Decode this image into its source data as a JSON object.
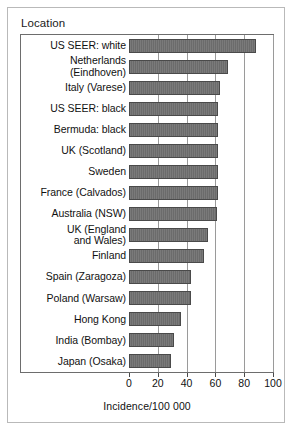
{
  "panel": {
    "title": "Location"
  },
  "chart_data": {
    "type": "bar",
    "orientation": "horizontal",
    "title": "Location",
    "xlabel": "Incidence/100 000",
    "ylabel": "Location",
    "xlim": [
      0,
      100
    ],
    "xticks": [
      0,
      20,
      40,
      60,
      80,
      100
    ],
    "xticklabels": [
      "0",
      "20",
      "40",
      "60",
      "80",
      "100"
    ],
    "grid": "vertical",
    "legend": "none",
    "bar_color": "#6b6b6b",
    "categories": [
      "US SEER: white",
      "Netherlands\n(Eindhoven)",
      "Italy (Varese)",
      "US SEER: black",
      "Bermuda: black",
      "UK (Scotland)",
      "Sweden",
      "France (Calvados)",
      "Australia (NSW)",
      "UK (England\nand Wales)",
      "Finland",
      "Spain (Zaragoza)",
      "Poland (Warsaw)",
      "Hong Kong",
      "India (Bombay)",
      "Japan (Osaka)"
    ],
    "values": [
      88,
      69,
      63,
      62,
      62,
      62,
      62,
      62,
      61,
      55,
      52,
      43,
      43,
      36,
      31,
      29
    ]
  },
  "axis": {
    "title": "Incidence/100 000"
  }
}
